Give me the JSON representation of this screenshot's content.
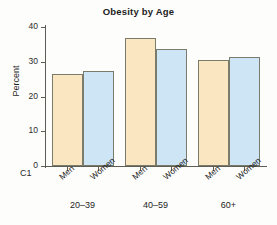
{
  "chart_data": {
    "type": "bar",
    "title": "Obesity by Age",
    "xlabel": "",
    "ylabel": "Percent",
    "ylim": [
      0,
      40
    ],
    "yticks": [
      0,
      10,
      20,
      30,
      40
    ],
    "grid": false,
    "legend": "none",
    "axis_variable_label": "C1",
    "categories": [
      "20–39",
      "40–59",
      "60+"
    ],
    "subcategories": [
      "Men",
      "Women"
    ],
    "series": [
      {
        "name": "Men",
        "color": "#fae7c2",
        "values": [
          26.4,
          36.9,
          30.5
        ]
      },
      {
        "name": "Women",
        "color": "#cde5f4",
        "values": [
          27.3,
          33.6,
          31.3
        ]
      }
    ],
    "bars": [
      {
        "group": "20–39",
        "series": "Men",
        "label": "Men",
        "value": 26.4
      },
      {
        "group": "20–39",
        "series": "Women",
        "label": "Women",
        "value": 27.3
      },
      {
        "group": "40–59",
        "series": "Men",
        "label": "Men",
        "value": 36.9
      },
      {
        "group": "40–59",
        "series": "Women",
        "label": "Women",
        "value": 33.6
      },
      {
        "group": "60+",
        "series": "Men",
        "label": "Men",
        "value": 30.5
      },
      {
        "group": "60+",
        "series": "Women",
        "label": "Women",
        "value": 31.3
      }
    ],
    "tick_labels": {
      "y": [
        "0",
        "10",
        "20",
        "30",
        "40"
      ],
      "x": [
        "Men",
        "Women",
        "Men",
        "Women",
        "Men",
        "Women"
      ],
      "groups": [
        "20–39",
        "40–59",
        "60+"
      ]
    },
    "colors": {
      "men_fill": "#fae7c2",
      "women_fill": "#cde5f4",
      "bar_border": "#7b7b6c",
      "axis": "#5d5d55",
      "text": "#1d1d1d",
      "background": "#fdfdfc"
    }
  }
}
